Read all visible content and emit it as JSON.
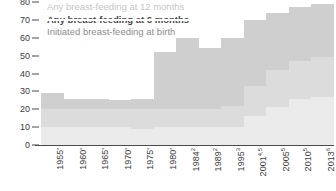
{
  "chart_data": {
    "type": "area",
    "title": "",
    "subtitle": "",
    "xlabel": "",
    "ylabel": "",
    "ylim": [
      0,
      80
    ],
    "yticks": [
      0,
      10,
      20,
      30,
      40,
      50,
      60,
      70,
      80
    ],
    "grid": true,
    "legend_position": "top-left",
    "categories": [
      "1955'",
      "1960'",
      "1965'",
      "1970'",
      "1975'",
      "1980'",
      "1984",
      "1989",
      "1995",
      "2001",
      "2005",
      "2010",
      "2013"
    ],
    "category_footnotes": [
      "",
      "",
      "",
      "",
      "",
      "",
      "2",
      "2",
      "3",
      "4,5",
      "5",
      "5",
      "6"
    ],
    "series": [
      {
        "name": "Initiated breast-feeding at birth",
        "color": "#cfcfcf",
        "values": [
          29,
          26,
          26,
          25,
          26,
          52,
          60,
          54,
          60,
          70,
          74,
          77,
          79
        ]
      },
      {
        "name": "Any breast-feeding at 6 months",
        "color": "#dcdcdc",
        "values": [
          20,
          20,
          20,
          20,
          20,
          20,
          20,
          20,
          22,
          33,
          42,
          47,
          49
        ]
      },
      {
        "name": "Any breast-feeding at 12 months",
        "color": "#ebebeb",
        "values": [
          10,
          10,
          10,
          10,
          9,
          10,
          10,
          10,
          10,
          16,
          21,
          26,
          27
        ]
      }
    ]
  },
  "legend": {
    "items": [
      {
        "label": "Any breast-feeding at 12 months"
      },
      {
        "label": "Any breast-feeding at 6 months"
      },
      {
        "label": "Initiated breast-feeding at birth"
      }
    ]
  }
}
